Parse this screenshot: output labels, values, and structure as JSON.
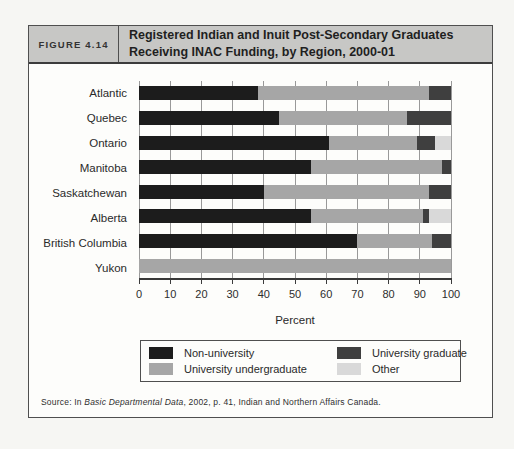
{
  "figure": {
    "label": "FIGURE 4.14",
    "title_line1": "Registered Indian and Inuit Post-Secondary Graduates",
    "title_line2": "Receiving INAC Funding, by Region, 2000-01"
  },
  "chart_data": {
    "type": "bar",
    "orientation": "horizontal",
    "stacked": true,
    "categories": [
      "Atlantic",
      "Quebec",
      "Ontario",
      "Manitoba",
      "Saskatchewan",
      "Alberta",
      "British Columbia",
      "Yukon"
    ],
    "series": [
      {
        "name": "Non-university",
        "color": "#1c1c1c",
        "values": [
          38,
          45,
          61,
          55,
          40,
          55,
          70,
          0
        ]
      },
      {
        "name": "University undergraduate",
        "color": "#a6a6a6",
        "values": [
          55,
          41,
          28,
          42,
          53,
          36,
          24,
          100
        ]
      },
      {
        "name": "University graduate",
        "color": "#3f3f3f",
        "values": [
          7,
          14,
          6,
          3,
          7,
          2,
          6,
          0
        ]
      },
      {
        "name": "Other",
        "color": "#d9d9d9",
        "values": [
          0,
          0,
          5,
          0,
          0,
          7,
          0,
          0
        ]
      }
    ],
    "xlabel": "Percent",
    "xlim": [
      0,
      100
    ],
    "xticks": [
      0,
      10,
      20,
      30,
      40,
      50,
      60,
      70,
      80,
      90,
      100
    ],
    "grid": true,
    "gridline_color": "#999999",
    "legend_position": "bottom-box"
  },
  "source": {
    "prefix": "Source: In ",
    "italic": "Basic Departmental Data",
    "suffix": ", 2002, p. 41, Indian and Northern Affairs Canada."
  },
  "colors": {
    "header_bg": "#c7c7c5",
    "figure_bg": "#fdfdfb",
    "page_bg": "#f6f6f3",
    "border": "#4f4f4f"
  }
}
